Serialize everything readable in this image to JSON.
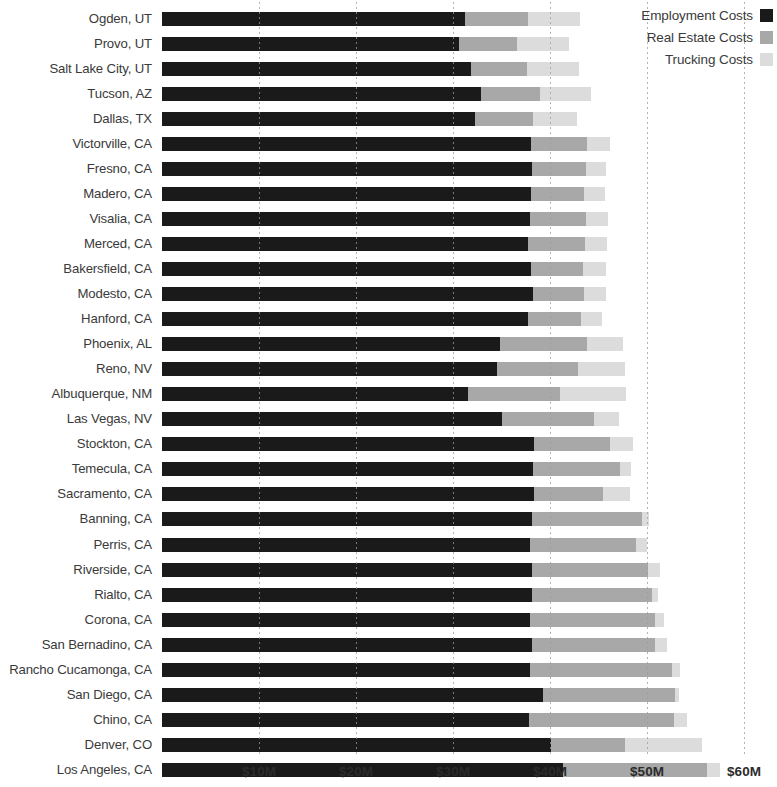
{
  "chart_data": {
    "type": "bar",
    "orientation": "horizontal",
    "stacked": true,
    "title": "",
    "subtitle": "",
    "xlabel": "",
    "ylabel": "",
    "xlim": [
      0,
      60
    ],
    "xtick_labels": [
      "$10M",
      "$20M",
      "$30M",
      "$40M",
      "$50M",
      "$60M"
    ],
    "xtick_values": [
      10,
      20,
      30,
      40,
      50,
      60
    ],
    "grid": true,
    "grid_axis": "x",
    "legend_position": "top-right",
    "units": "millions of USD",
    "legend": [
      {
        "name": "Employment Costs",
        "color": "#1a1a1a"
      },
      {
        "name": "Real Estate Costs",
        "color": "#a8a8a8"
      },
      {
        "name": "Trucking Costs",
        "color": "#dcdcdc"
      }
    ],
    "categories": [
      "Ogden, UT",
      "Provo, UT",
      "Salt Lake City, UT",
      "Tucson, AZ",
      "Dallas, TX",
      "Victorville, CA",
      "Fresno, CA",
      "Madero, CA",
      "Visalia, CA",
      "Merced, CA",
      "Bakersfield, CA",
      "Modesto, CA",
      "Hanford, CA",
      "Phoenix, AL",
      "Reno, NV",
      "Albuquerque, NM",
      "Las Vegas, NV",
      "Stockton, CA",
      "Temecula, CA",
      "Sacramento, CA",
      "Banning, CA",
      "Perris, CA",
      "Riverside, CA",
      "Rialto, CA",
      "Corona, CA",
      "San Bernadino, CA",
      "Rancho Cucamonga, CA",
      "San Diego, CA",
      "Chino, CA",
      "Denver, CO",
      "Los Angeles, CA"
    ],
    "series": [
      {
        "name": "Employment Costs",
        "color": "#1a1a1a",
        "values": [
          31.2,
          30.6,
          31.9,
          32.9,
          32.3,
          38.0,
          38.1,
          38.0,
          37.9,
          37.7,
          38.0,
          38.2,
          37.7,
          34.8,
          34.5,
          31.5,
          35.0,
          38.4,
          38.2,
          38.3,
          38.1,
          37.9,
          38.1,
          38.1,
          37.9,
          38.1,
          37.9,
          39.3,
          37.8,
          40.1,
          41.3
        ]
      },
      {
        "name": "Real Estate Costs",
        "color": "#a8a8a8",
        "values": [
          6.5,
          6.0,
          5.7,
          6.1,
          5.9,
          5.8,
          5.6,
          5.5,
          5.8,
          5.9,
          5.4,
          5.3,
          5.5,
          9.0,
          8.4,
          9.5,
          9.5,
          7.8,
          9.0,
          7.2,
          11.4,
          11.0,
          12.0,
          12.4,
          12.9,
          12.7,
          14.7,
          13.6,
          15.0,
          7.6,
          14.9
        ]
      },
      {
        "name": "Trucking Costs",
        "color": "#dcdcdc",
        "values": [
          5.4,
          5.4,
          5.4,
          5.2,
          4.6,
          2.4,
          2.1,
          2.2,
          2.3,
          2.3,
          2.4,
          2.3,
          2.2,
          3.7,
          4.8,
          6.8,
          2.6,
          2.4,
          1.2,
          2.7,
          0.7,
          1.1,
          1.2,
          0.6,
          1.0,
          1.3,
          0.8,
          0.4,
          1.3,
          8.0,
          1.3
        ]
      }
    ]
  }
}
